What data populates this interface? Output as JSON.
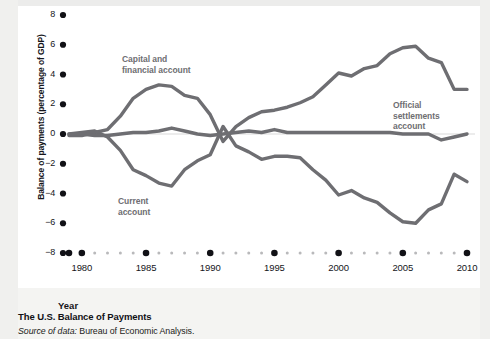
{
  "caption": {
    "title": "The U.S. Balance of Payments",
    "source_lead": "Source of data:",
    "source_body": " Bureau of Economic Analysis."
  },
  "axes": {
    "x_title": "Year",
    "y_title": "Balance of payments (percentage of GDP)"
  },
  "colors": {
    "line": "#6e6e72",
    "tick": "#111116",
    "minor_tick": "#b9b9bb",
    "zero_line": "#d9d9d9",
    "plot_background": "#ffffff",
    "page_background": "#f4f4f2",
    "label_text": "#6e6e72"
  },
  "chart_data": {
    "type": "line",
    "title": "The U.S. Balance of Payments",
    "xlabel": "Year",
    "ylabel": "Balance of payments (percentage of GDP)",
    "xlim": [
      1979,
      2010
    ],
    "ylim": [
      -8,
      8
    ],
    "ytick_labels": [
      "8",
      "6",
      "4",
      "2",
      "0",
      "-2",
      "-4",
      "-6",
      "-8"
    ],
    "ytick_values": [
      8,
      6,
      4,
      2,
      0,
      -2,
      -4,
      -6,
      -8
    ],
    "xtick_labels": [
      "1980",
      "1985",
      "1990",
      "1995",
      "2000",
      "2005",
      "2010"
    ],
    "xtick_values": [
      1980,
      1985,
      1990,
      1995,
      2000,
      2005,
      2010
    ],
    "grid": false,
    "legend": "inline-annotations",
    "x": [
      1979,
      1980,
      1981,
      1982,
      1983,
      1984,
      1985,
      1986,
      1987,
      1988,
      1989,
      1990,
      1991,
      1992,
      1993,
      1994,
      1995,
      1996,
      1997,
      1998,
      1999,
      2000,
      2001,
      2002,
      2003,
      2004,
      2005,
      2006,
      2007,
      2008,
      2009,
      2010
    ],
    "series": [
      {
        "name": "Capital and financial account",
        "label": "Capital and\nfinancial account",
        "label_line1": "Capital and",
        "label_line2": "financial account",
        "values": [
          -0.1,
          -0.1,
          0.1,
          0.3,
          1.2,
          2.4,
          3.0,
          3.3,
          3.2,
          2.6,
          2.4,
          1.3,
          -0.5,
          0.5,
          1.1,
          1.5,
          1.6,
          1.8,
          2.1,
          2.5,
          3.3,
          4.1,
          3.9,
          4.4,
          4.6,
          5.4,
          5.8,
          5.9,
          5.1,
          4.8,
          3.0,
          3.0
        ]
      },
      {
        "name": "Current account",
        "label": "Current\naccount",
        "label_line1": "Current",
        "label_line2": "account",
        "values": [
          0.0,
          0.1,
          0.2,
          -0.2,
          -1.1,
          -2.4,
          -2.8,
          -3.3,
          -3.5,
          -2.4,
          -1.8,
          -1.4,
          0.5,
          -0.8,
          -1.2,
          -1.7,
          -1.5,
          -1.5,
          -1.6,
          -2.4,
          -3.1,
          -4.1,
          -3.8,
          -4.3,
          -4.6,
          -5.3,
          -5.9,
          -6.0,
          -5.1,
          -4.7,
          -2.7,
          -3.2
        ]
      },
      {
        "name": "Official settlements account",
        "label": "Official\nsettlements\naccount",
        "label_line1": "Official",
        "label_line2": "settlements",
        "label_line3": "account",
        "values": [
          0.0,
          0.0,
          -0.1,
          -0.1,
          0.0,
          0.1,
          0.1,
          0.2,
          0.4,
          0.2,
          0.0,
          -0.1,
          0.0,
          0.1,
          0.2,
          0.1,
          0.3,
          0.1,
          0.1,
          0.1,
          0.1,
          0.1,
          0.1,
          0.1,
          0.1,
          0.1,
          0.0,
          0.0,
          0.0,
          -0.4,
          -0.2,
          0.0
        ]
      }
    ]
  }
}
